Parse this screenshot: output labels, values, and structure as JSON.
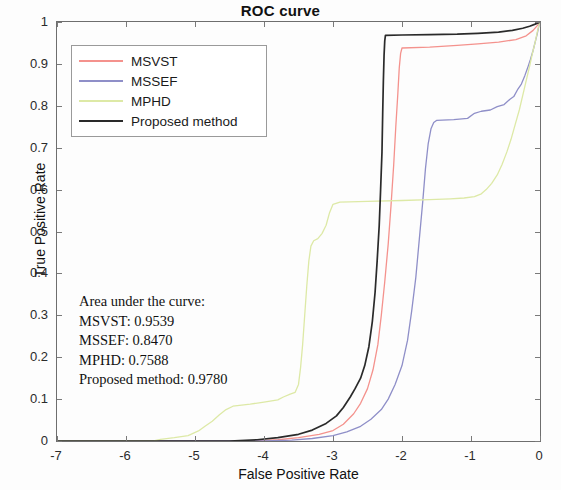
{
  "chart_data": {
    "type": "line",
    "title": "ROC curve",
    "xlabel": "False Positive Rate",
    "ylabel": "True Positive Rate",
    "xlim": [
      -7,
      0
    ],
    "ylim": [
      0,
      1
    ],
    "xticks": [
      "-7",
      "-6",
      "-5",
      "-4",
      "-3",
      "-2",
      "-1",
      "0"
    ],
    "yticks": [
      "0",
      "0.1",
      "0.2",
      "0.3",
      "0.4",
      "0.5",
      "0.6",
      "0.7",
      "0.8",
      "0.9",
      "1"
    ],
    "grid": false,
    "legend_position": "upper left",
    "note": "x axis is log10 of false positive rate",
    "series": [
      {
        "name": "MSVST",
        "color": "#f4928d",
        "auc": "0.9539",
        "points": [
          [
            -7.0,
            0.0
          ],
          [
            -4.2,
            0.0
          ],
          [
            -3.8,
            0.003
          ],
          [
            -3.5,
            0.008
          ],
          [
            -3.2,
            0.016
          ],
          [
            -3.0,
            0.025
          ],
          [
            -2.85,
            0.04
          ],
          [
            -2.7,
            0.065
          ],
          [
            -2.6,
            0.09
          ],
          [
            -2.5,
            0.125
          ],
          [
            -2.42,
            0.17
          ],
          [
            -2.35,
            0.23
          ],
          [
            -2.3,
            0.3
          ],
          [
            -2.25,
            0.38
          ],
          [
            -2.2,
            0.47
          ],
          [
            -2.16,
            0.56
          ],
          [
            -2.12,
            0.66
          ],
          [
            -2.09,
            0.75
          ],
          [
            -2.06,
            0.83
          ],
          [
            -2.04,
            0.89
          ],
          [
            -2.02,
            0.925
          ],
          [
            -2.0,
            0.938
          ],
          [
            -1.6,
            0.94
          ],
          [
            -1.2,
            0.944
          ],
          [
            -0.9,
            0.948
          ],
          [
            -0.6,
            0.952
          ],
          [
            -0.35,
            0.958
          ],
          [
            -0.2,
            0.967
          ],
          [
            -0.1,
            0.98
          ],
          [
            -0.03,
            0.993
          ],
          [
            0.0,
            1.0
          ]
        ]
      },
      {
        "name": "MSSEF",
        "color": "#8f8fc8",
        "auc": "0.8470",
        "points": [
          [
            -7.0,
            0.0
          ],
          [
            -4.0,
            0.0
          ],
          [
            -3.6,
            0.002
          ],
          [
            -3.3,
            0.006
          ],
          [
            -3.0,
            0.013
          ],
          [
            -2.8,
            0.022
          ],
          [
            -2.6,
            0.035
          ],
          [
            -2.45,
            0.052
          ],
          [
            -2.3,
            0.075
          ],
          [
            -2.2,
            0.1
          ],
          [
            -2.1,
            0.135
          ],
          [
            -2.0,
            0.18
          ],
          [
            -1.92,
            0.24
          ],
          [
            -1.86,
            0.31
          ],
          [
            -1.8,
            0.39
          ],
          [
            -1.75,
            0.48
          ],
          [
            -1.7,
            0.57
          ],
          [
            -1.66,
            0.65
          ],
          [
            -1.62,
            0.71
          ],
          [
            -1.58,
            0.745
          ],
          [
            -1.54,
            0.76
          ],
          [
            -1.5,
            0.765
          ],
          [
            -1.25,
            0.767
          ],
          [
            -1.05,
            0.77
          ],
          [
            -0.95,
            0.782
          ],
          [
            -0.85,
            0.787
          ],
          [
            -0.72,
            0.79
          ],
          [
            -0.62,
            0.798
          ],
          [
            -0.52,
            0.803
          ],
          [
            -0.44,
            0.815
          ],
          [
            -0.38,
            0.822
          ],
          [
            -0.32,
            0.84
          ],
          [
            -0.27,
            0.852
          ],
          [
            -0.22,
            0.872
          ],
          [
            -0.18,
            0.89
          ],
          [
            -0.14,
            0.91
          ],
          [
            -0.1,
            0.932
          ],
          [
            -0.07,
            0.952
          ],
          [
            -0.04,
            0.972
          ],
          [
            -0.02,
            0.988
          ],
          [
            0.0,
            1.0
          ]
        ]
      },
      {
        "name": "MPHD",
        "color": "#dde9a6",
        "auc": "0.7588",
        "points": [
          [
            -7.0,
            0.0
          ],
          [
            -5.6,
            0.0
          ],
          [
            -5.5,
            0.004
          ],
          [
            -5.3,
            0.008
          ],
          [
            -5.1,
            0.013
          ],
          [
            -4.95,
            0.024
          ],
          [
            -4.85,
            0.036
          ],
          [
            -4.75,
            0.047
          ],
          [
            -4.65,
            0.062
          ],
          [
            -4.55,
            0.075
          ],
          [
            -4.45,
            0.083
          ],
          [
            -4.2,
            0.088
          ],
          [
            -4.0,
            0.093
          ],
          [
            -3.8,
            0.098
          ],
          [
            -3.72,
            0.105
          ],
          [
            -3.62,
            0.112
          ],
          [
            -3.55,
            0.116
          ],
          [
            -3.5,
            0.135
          ],
          [
            -3.47,
            0.175
          ],
          [
            -3.44,
            0.23
          ],
          [
            -3.41,
            0.3
          ],
          [
            -3.38,
            0.37
          ],
          [
            -3.35,
            0.43
          ],
          [
            -3.32,
            0.465
          ],
          [
            -3.28,
            0.478
          ],
          [
            -3.22,
            0.483
          ],
          [
            -3.16,
            0.495
          ],
          [
            -3.1,
            0.515
          ],
          [
            -3.05,
            0.545
          ],
          [
            -3.0,
            0.565
          ],
          [
            -2.9,
            0.57
          ],
          [
            -2.5,
            0.572
          ],
          [
            -2.0,
            0.574
          ],
          [
            -1.6,
            0.576
          ],
          [
            -1.3,
            0.578
          ],
          [
            -1.1,
            0.58
          ],
          [
            -0.95,
            0.583
          ],
          [
            -0.85,
            0.59
          ],
          [
            -0.78,
            0.6
          ],
          [
            -0.7,
            0.615
          ],
          [
            -0.62,
            0.635
          ],
          [
            -0.55,
            0.66
          ],
          [
            -0.48,
            0.69
          ],
          [
            -0.42,
            0.72
          ],
          [
            -0.36,
            0.755
          ],
          [
            -0.3,
            0.79
          ],
          [
            -0.25,
            0.825
          ],
          [
            -0.2,
            0.86
          ],
          [
            -0.15,
            0.895
          ],
          [
            -0.11,
            0.925
          ],
          [
            -0.07,
            0.952
          ],
          [
            -0.04,
            0.975
          ],
          [
            -0.02,
            0.99
          ],
          [
            0.0,
            1.0
          ]
        ]
      },
      {
        "name": "Proposed method",
        "color": "#2a2a2a",
        "auc": "0.9780",
        "points": [
          [
            -7.0,
            0.0
          ],
          [
            -4.5,
            0.0
          ],
          [
            -4.1,
            0.003
          ],
          [
            -3.8,
            0.008
          ],
          [
            -3.5,
            0.016
          ],
          [
            -3.3,
            0.026
          ],
          [
            -3.1,
            0.042
          ],
          [
            -2.95,
            0.06
          ],
          [
            -2.85,
            0.08
          ],
          [
            -2.75,
            0.105
          ],
          [
            -2.68,
            0.125
          ],
          [
            -2.6,
            0.15
          ],
          [
            -2.54,
            0.18
          ],
          [
            -2.48,
            0.225
          ],
          [
            -2.43,
            0.285
          ],
          [
            -2.39,
            0.355
          ],
          [
            -2.36,
            0.43
          ],
          [
            -2.33,
            0.515
          ],
          [
            -2.31,
            0.6
          ],
          [
            -2.29,
            0.69
          ],
          [
            -2.28,
            0.78
          ],
          [
            -2.27,
            0.86
          ],
          [
            -2.26,
            0.92
          ],
          [
            -2.25,
            0.955
          ],
          [
            -2.24,
            0.968
          ],
          [
            -2.0,
            0.969
          ],
          [
            -1.6,
            0.97
          ],
          [
            -1.2,
            0.971
          ],
          [
            -0.9,
            0.973
          ],
          [
            -0.6,
            0.976
          ],
          [
            -0.4,
            0.98
          ],
          [
            -0.25,
            0.985
          ],
          [
            -0.15,
            0.99
          ],
          [
            -0.07,
            0.995
          ],
          [
            0.0,
            1.0
          ]
        ]
      }
    ]
  },
  "legend": {
    "items": [
      {
        "label": "MSVST",
        "color": "#f4928d"
      },
      {
        "label": "MSSEF",
        "color": "#8f8fc8"
      },
      {
        "label": "MPHD",
        "color": "#dde9a6"
      },
      {
        "label": "Proposed method",
        "color": "#2a2a2a"
      }
    ]
  },
  "auc_annotation": {
    "heading": "Area under the curve:",
    "lines": [
      "MSVST: 0.9539",
      "MSSEF: 0.8470",
      "MPHD: 0.7588",
      "Proposed method: 0.9780"
    ]
  }
}
